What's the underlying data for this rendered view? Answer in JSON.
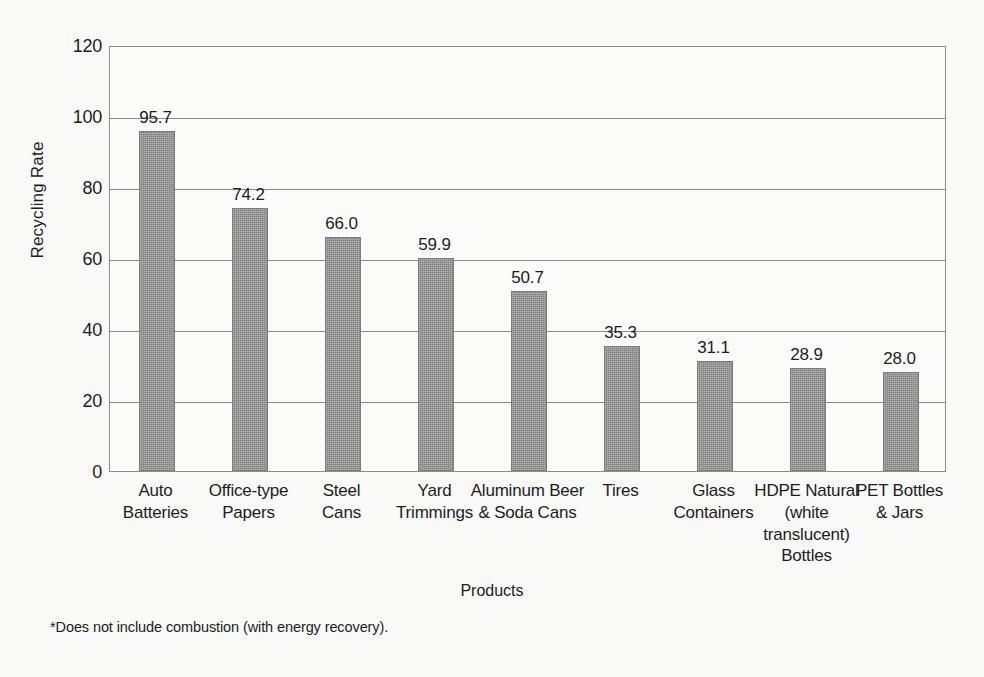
{
  "chart_data": {
    "type": "bar",
    "title": "",
    "subtitle": "",
    "xlabel": "Products",
    "ylabel": "Recycling Rate",
    "ylim": [
      0,
      120
    ],
    "yticks": [
      0,
      20,
      40,
      60,
      80,
      100,
      120
    ],
    "ytick_labels": [
      "0",
      "20",
      "40",
      "60",
      "80",
      "100",
      "120"
    ],
    "grid": true,
    "grid_axis": "y",
    "legend": false,
    "legend_position": "none",
    "bar_color": "#8e8e8e",
    "categories": [
      "Auto Batteries",
      "Office-type Papers",
      "Steel Cans",
      "Yard Trimmings",
      "Aluminum Beer & Soda Cans",
      "Tires",
      "Glass Containers",
      "HDPE Natural (white translucent) Bottles",
      "PET Bottles & Jars"
    ],
    "category_lines": [
      [
        "Auto",
        "Batteries"
      ],
      [
        "Office-type",
        "Papers"
      ],
      [
        "Steel",
        "Cans"
      ],
      [
        "Yard",
        "Trimmings"
      ],
      [
        "Aluminum Beer",
        "& Soda Cans"
      ],
      [
        "Tires"
      ],
      [
        "Glass",
        "Containers"
      ],
      [
        "HDPE Natural",
        "(white",
        "translucent)",
        "Bottles"
      ],
      [
        "PET Bottles",
        "& Jars"
      ]
    ],
    "values": [
      95.7,
      74.2,
      66.0,
      59.9,
      50.7,
      35.3,
      31.1,
      28.9,
      28.0
    ],
    "value_labels": [
      "95.7",
      "74.2",
      "66.0",
      "59.9",
      "50.7",
      "35.3",
      "31.1",
      "28.9",
      "28.0"
    ],
    "annotations": [
      "*Does not include combustion (with energy recovery)."
    ]
  },
  "footnote": "*Does not include combustion (with energy recovery)."
}
